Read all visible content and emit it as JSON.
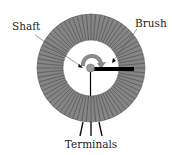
{
  "diagram": {
    "type": "potentiometer",
    "labels": {
      "shaft": "Shaft",
      "brush": "Brush",
      "terminals": "Terminals"
    },
    "colors": {
      "winding": "#7d7d7d",
      "winding_lines": "#4a4a4a",
      "brush": "#000000",
      "arrow": "#8a8a8a",
      "shaft": "#9a9a9a",
      "background": "#ffffff"
    },
    "terminal_count": 3
  }
}
